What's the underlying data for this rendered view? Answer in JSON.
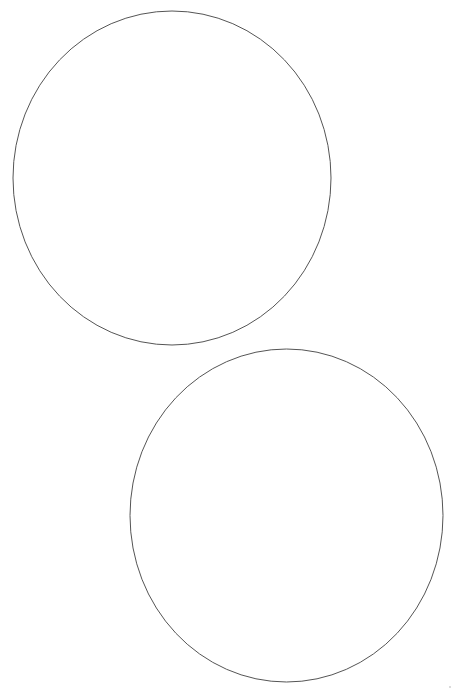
{
  "page": {
    "width": 456,
    "height": 693,
    "background_color": "#ffffff"
  },
  "style": {
    "stroke_color": "#555555",
    "stroke_width": 1,
    "fill": "none",
    "artifact_color": "#cfcfcf"
  },
  "chart_data": {
    "type": "scatter",
    "xlabel": "",
    "ylabel": "",
    "xlim": [
      0,
      456
    ],
    "ylim": [
      0,
      693
    ],
    "grid": false,
    "legend": "none",
    "annotations": [],
    "shapes": [
      {
        "id": "circle-top",
        "name": "upper-circle",
        "kind": "ellipse",
        "center_x": 172,
        "center_y": 178,
        "radius_x": 159,
        "radius_y": 167,
        "bbox": {
          "left": 13,
          "top": 11,
          "right": 331,
          "bottom": 345
        },
        "stroke": "#555555",
        "stroke_width": 1,
        "fill": "none"
      },
      {
        "id": "circle-bottom",
        "name": "lower-circle",
        "kind": "ellipse",
        "center_x": 286.5,
        "center_y": 515.5,
        "radius_x": 156.5,
        "radius_y": 166.5,
        "bbox": {
          "left": 130,
          "top": 349,
          "right": 443,
          "bottom": 682
        },
        "stroke": "#555555",
        "stroke_width": 1,
        "fill": "none"
      }
    ],
    "artifacts": [
      {
        "id": "speck-bottom-right",
        "name": "scan-speck",
        "kind": "dot",
        "center_x": 450,
        "center_y": 687,
        "radius": 1,
        "color": "#cfcfcf"
      }
    ]
  }
}
